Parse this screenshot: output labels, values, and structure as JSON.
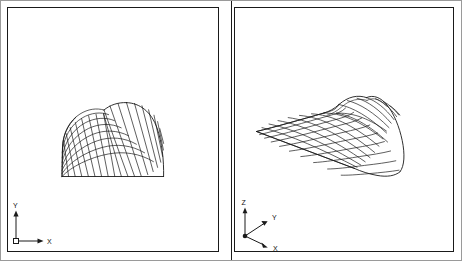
{
  "figure": {
    "background_color": "#ffffff",
    "line_color": "#1a1a1a",
    "frame_color": "#9a9a9a",
    "panel_count": 2
  },
  "panels": [
    {
      "id": "left",
      "view_name": "xy-plan-view",
      "projection": "orthographic-xy",
      "axis_indicator": {
        "type": "2d-axis-cross",
        "origin_marker": "square",
        "axes": [
          {
            "name": "y-axis",
            "label": "Y",
            "direction": "up"
          },
          {
            "name": "x-axis",
            "label": "X",
            "direction": "right"
          }
        ]
      }
    },
    {
      "id": "right",
      "view_name": "isometric-3d-view",
      "projection": "isometric",
      "axis_indicator": {
        "type": "3d-axis-triad",
        "origin_marker": "dot",
        "axes": [
          {
            "name": "z-axis",
            "label": "Z",
            "direction": "up"
          },
          {
            "name": "y-axis",
            "label": "Y",
            "direction": "upper-right"
          },
          {
            "name": "x-axis",
            "label": "X",
            "direction": "lower-right"
          }
        ]
      }
    }
  ],
  "mesh": {
    "name": "quarter-annulus-quad-mesh",
    "element_type": "quadrilateral",
    "radial_divisions": 8,
    "circumferential_divisions": 14,
    "description": "Structured quadrilateral finite-element mesh of a quarter plate with a concave inner fillet arc"
  }
}
